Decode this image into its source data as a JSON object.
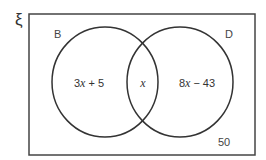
{
  "universal_symbol": "ξ",
  "sets": [
    {
      "name": "B",
      "expression_prefix": "3",
      "variable": "x",
      "expression_suffix": " + 5"
    },
    {
      "name": "D",
      "expression_prefix": "8",
      "variable": "x",
      "expression_suffix": " − 43"
    }
  ],
  "intersection": {
    "variable": "x"
  },
  "outside": "50",
  "colors": {
    "line": "#333333",
    "text": "#444444"
  }
}
